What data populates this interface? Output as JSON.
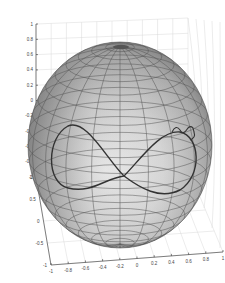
{
  "chart_data": {
    "type": "surface3d",
    "title": "",
    "surface": {
      "shape": "sphere",
      "radius": 1,
      "center": [
        0,
        0,
        0
      ],
      "colormap": "gray",
      "mesh_lines": true,
      "latitude_divisions": 20,
      "longitude_divisions": 20
    },
    "curve": {
      "shape": "figure-eight",
      "color": "#333333",
      "note": "lemniscate-like path on the front of the sphere, crossing near x=0.2, z=-0.45; right lobe shows small loops near top"
    },
    "axes": {
      "x": {
        "ticks": [
          "-1",
          "-0.8",
          "-0.6",
          "-0.4",
          "-0.2",
          "0",
          "0.2",
          "0.4",
          "0.6",
          "0.8",
          "1"
        ],
        "range": [
          -1,
          1
        ],
        "label": ""
      },
      "y": {
        "ticks": [
          "1",
          "0.5",
          "0",
          "-0.5",
          "-1"
        ],
        "range": [
          -1,
          1
        ],
        "label": ""
      },
      "z": {
        "ticks": [
          "1",
          "0.8",
          "0.6",
          "0.4",
          "0.2",
          "0",
          "-0.2",
          "-0.4",
          "-0.6",
          "-0.8",
          "-1"
        ],
        "range": [
          -1,
          1
        ],
        "label": ""
      }
    },
    "grid": true,
    "legend": null
  },
  "colors": {
    "grid": "#d8d8d8",
    "axis": "#333333",
    "curve": "#333333",
    "mesh": "#555555"
  }
}
